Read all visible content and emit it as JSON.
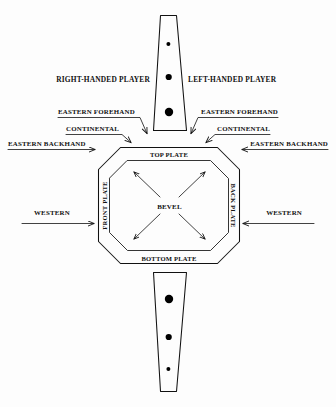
{
  "diagram": {
    "background_color": "#fdfdfd",
    "ink_color": "#111111",
    "players": {
      "right": "RIGHT-HANDED PLAYER",
      "left": "LEFT-HANDED PLAYER"
    },
    "left_side_grips": [
      {
        "label": "EASTERN FOREHAND"
      },
      {
        "label": "CONTINENTAL"
      },
      {
        "label": "EASTERN BACKHAND"
      },
      {
        "label": "WESTERN"
      }
    ],
    "right_side_grips": [
      {
        "label": "EASTERN FOREHAND"
      },
      {
        "label": "CONTINENTAL"
      },
      {
        "label": "EASTERN BACKHAND"
      },
      {
        "label": "WESTERN"
      }
    ],
    "plates": {
      "top": "TOP PLATE",
      "bottom": "BOTTOM PLATE",
      "front": "FRONT PLATE",
      "back": "BACK PLATE",
      "center": "BEVEL"
    },
    "handle": {
      "upper_dots": 3,
      "lower_dots": 3
    }
  }
}
